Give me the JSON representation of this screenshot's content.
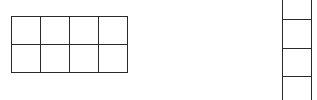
{
  "diagram": {
    "type": "grid",
    "line_color": "#2a2a2a",
    "background": "#ffffff",
    "left_grid": {
      "rows": 2,
      "cols": 4,
      "x": 11,
      "y": 16,
      "cell_width": 29,
      "cell_height": 28
    },
    "right_column": {
      "x": 282,
      "width": 30,
      "top": 0,
      "height": 100,
      "divider_y": [
        19,
        48,
        76
      ]
    }
  }
}
